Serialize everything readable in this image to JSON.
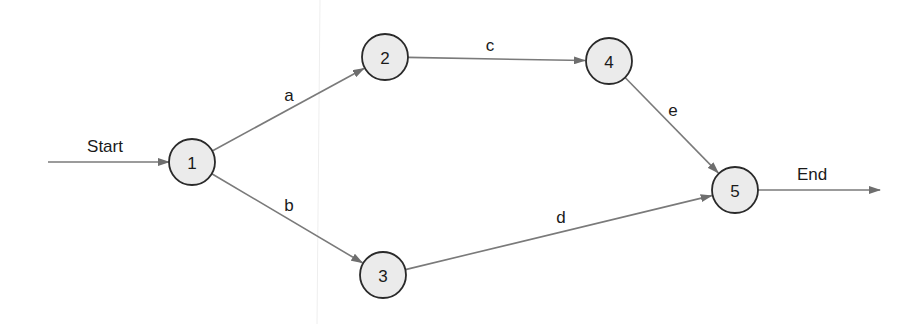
{
  "diagram": {
    "type": "network-activity-diagram",
    "colors": {
      "node_fill": "#ebebeb",
      "node_stroke": "#2a2a2a",
      "edge": "#7a7a7a",
      "text": "#1a1a1a"
    },
    "nodes": [
      {
        "id": "1",
        "label": "1",
        "x": 192,
        "y": 162
      },
      {
        "id": "2",
        "label": "2",
        "x": 385,
        "y": 57
      },
      {
        "id": "3",
        "label": "3",
        "x": 383,
        "y": 275
      },
      {
        "id": "4",
        "label": "4",
        "x": 609,
        "y": 61
      },
      {
        "id": "5",
        "label": "5",
        "x": 735,
        "y": 190
      }
    ],
    "edges": [
      {
        "from": "1",
        "to": "2",
        "label": "a",
        "label_x": 289,
        "label_y": 95
      },
      {
        "from": "1",
        "to": "3",
        "label": "b",
        "label_x": 289,
        "label_y": 205
      },
      {
        "from": "2",
        "to": "4",
        "label": "c",
        "label_x": 490,
        "label_y": 45
      },
      {
        "from": "3",
        "to": "5",
        "label": "d",
        "label_x": 561,
        "label_y": 217
      },
      {
        "from": "4",
        "to": "5",
        "label": "e",
        "label_x": 673,
        "label_y": 110
      }
    ],
    "start": {
      "label": "Start",
      "label_x": 105,
      "label_y": 146,
      "from_x": 48,
      "y": 162,
      "to": "1"
    },
    "end": {
      "label": "End",
      "label_x": 812,
      "label_y": 174,
      "from": "5",
      "to_x": 880,
      "y": 190
    }
  }
}
